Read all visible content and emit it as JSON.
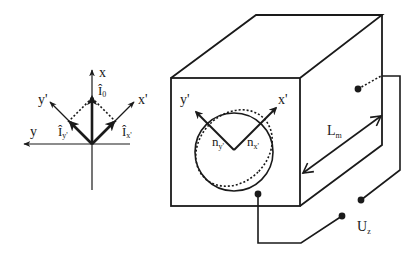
{
  "left_diagram": {
    "axes": {
      "x_label": "x",
      "y_label": "y",
      "x_prime_label": "x'",
      "y_prime_label": "y'"
    },
    "vectors": {
      "i0_hat": "Î",
      "i0_sub": "0",
      "iy_hat": "Î",
      "iy_sub": "y'",
      "ix_hat": "Î",
      "ix_sub": "x'"
    }
  },
  "right_diagram": {
    "face_axes": {
      "x_prime_label": "x'",
      "y_prime_label": "y'"
    },
    "refractive_indices": {
      "ny_main": "n",
      "ny_sub": "y'",
      "nx_main": "n",
      "nx_sub": "x'"
    },
    "length": {
      "main": "L",
      "sub": "m"
    },
    "voltage": {
      "main": "U",
      "sub": "z"
    }
  },
  "colors": {
    "stroke": "#1a1a1a",
    "background": "#ffffff"
  }
}
